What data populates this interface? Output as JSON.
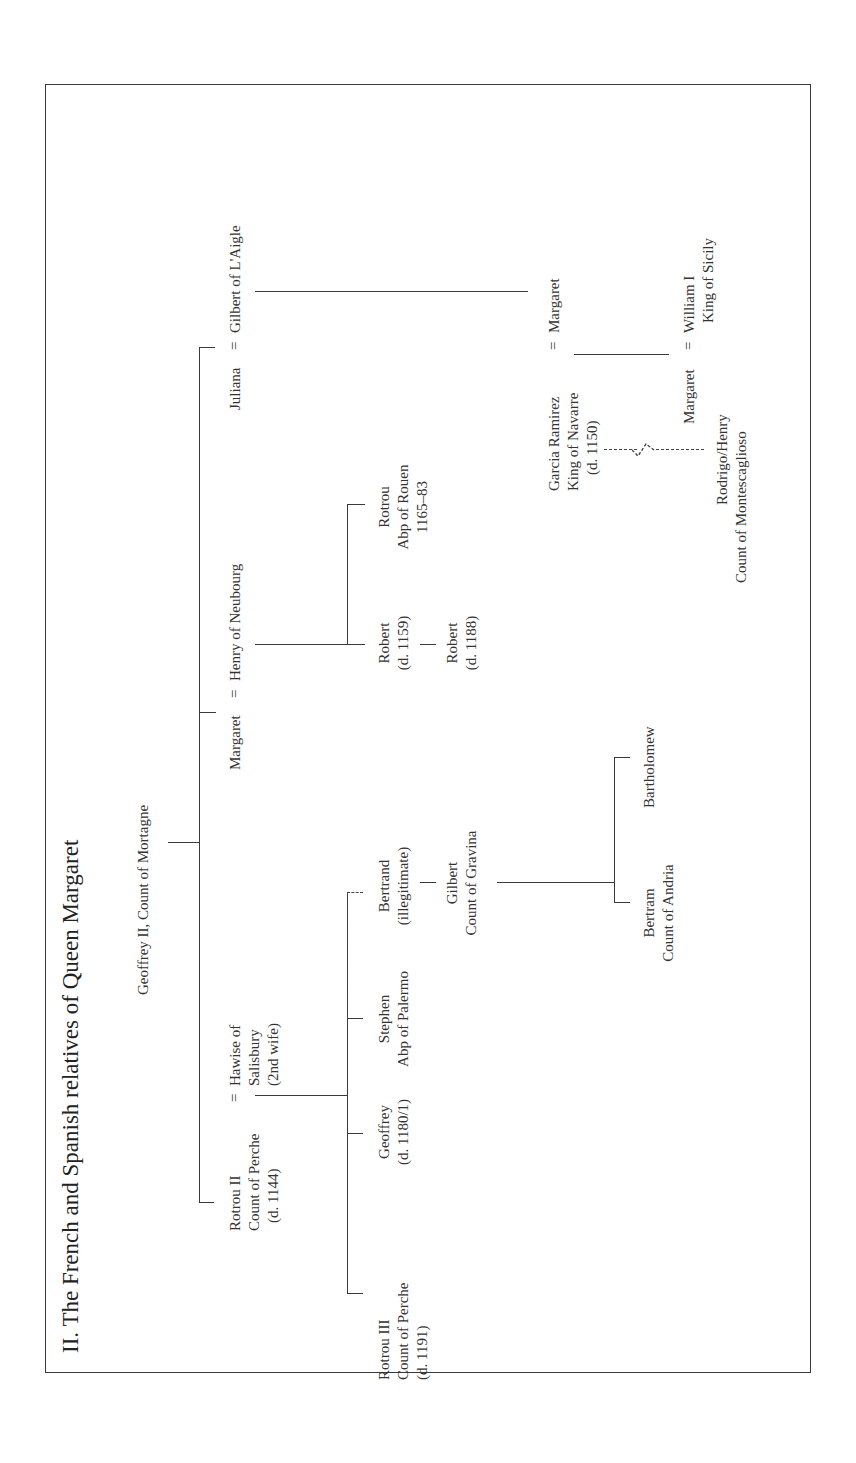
{
  "title": "II.  The French and Spanish relatives of Queen Margaret",
  "orientation": "rotated 90° counter-clockwise",
  "marriage_symbol": "=",
  "people": {
    "geoffrey_ii": {
      "line1": "Geoffrey II, Count of Mortagne"
    },
    "rotrou_ii": {
      "line1": "Rotrou II",
      "line2": "Count of Perche",
      "line3": "(d. 1144)"
    },
    "hawise": {
      "line1": "Hawise of",
      "line2": "Salisbury",
      "line3": "(2nd wife)"
    },
    "margaret_neubourg": {
      "line1": "Margaret"
    },
    "henry_neubourg": {
      "line1": "Henry of Neubourg"
    },
    "juliana": {
      "line1": "Juliana"
    },
    "gilbert_laigle": {
      "line1": "Gilbert of L'Aigle"
    },
    "rotrou_iii": {
      "line1": "Rotrou III",
      "line2": "Count of Perche",
      "line3": "(d. 1191)"
    },
    "geoffrey": {
      "line1": "Geoffrey",
      "line2": "(d. 1180/1)"
    },
    "stephen": {
      "line1": "Stephen",
      "line2": "Abp of Palermo"
    },
    "bertrand": {
      "line1": "Bertrand",
      "line2": "(illegitimate)"
    },
    "robert_1159": {
      "line1": "Robert",
      "line2": "(d. 1159)"
    },
    "rotrou_rouen": {
      "line1": "Rotrou",
      "line2": "Abp of Rouen",
      "line3": "1165–83"
    },
    "gilbert_gravina": {
      "line1": "Gilbert",
      "line2": "Count of Gravina"
    },
    "robert_1188": {
      "line1": "Robert",
      "line2": "(d. 1188)"
    },
    "bertram": {
      "line1": "Bertram",
      "line2": "Count of Andria"
    },
    "bartholomew": {
      "line1": "Bartholomew"
    },
    "garcia_ramirez": {
      "line1": "Garcia Ramirez",
      "line2": "King of Navarre",
      "line3": "(d. 1150)"
    },
    "margaret_laigle": {
      "line1": "Margaret"
    },
    "margaret_queen": {
      "line1": "Margaret"
    },
    "william_i": {
      "line1": "William I",
      "line2": "King of Sicily"
    },
    "rodrigo_henry": {
      "line1": "Rodrigo/Henry",
      "line2": "Count of Montescaglioso"
    }
  },
  "colors": {
    "line": "#3a3a3a",
    "text": "#333333",
    "background": "#ffffff"
  }
}
